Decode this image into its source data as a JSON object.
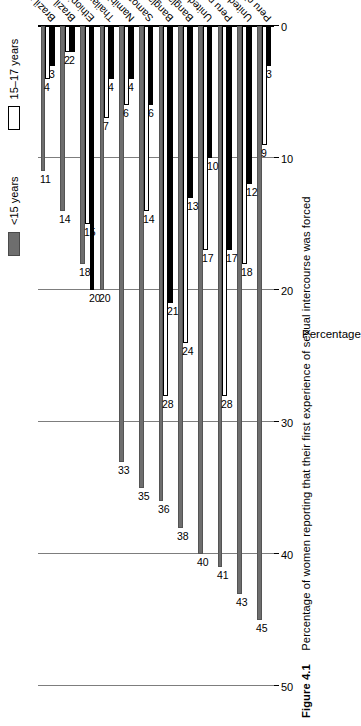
{
  "figure": {
    "number": "Figure 4.1",
    "caption": "Percentage of women reporting that their first experience of sexual intercourse was forced"
  },
  "legend": {
    "position": "top-left",
    "items": [
      {
        "label": "<15 years",
        "color": "#6e6e6e",
        "key": "under15"
      },
      {
        "label": "15–17 years",
        "color": "#ffffff",
        "key": "a1517"
      },
      {
        "label": "18+ years",
        "color": "#000000",
        "key": "a18plus"
      }
    ]
  },
  "axes": {
    "value_axis_label": "Percentage",
    "ticks": [
      "0",
      "10",
      "20",
      "30",
      "40",
      "50"
    ],
    "ylim": [
      0,
      50
    ],
    "grid": true
  },
  "chart_data": {
    "type": "bar",
    "orientation": "horizontal",
    "title": "Percentage of women reporting that their first experience of sexual intercourse was forced",
    "xlabel": "",
    "ylabel": "Percentage",
    "ylim": [
      0,
      50
    ],
    "grid": true,
    "legend_position": "top-left",
    "categories": [
      "Peru city",
      "United Republic of Tanzania province",
      "Peru province",
      "United Republic of Tanzania city",
      "Bangladesh city",
      "Bangladesh province",
      "Samoa",
      "Namibia city",
      "Thailand province",
      "Ethiopia province",
      "Brazil city",
      "Brazil province"
    ],
    "series": [
      {
        "name": "<15 years",
        "color": "#6e6e6e",
        "values": [
          45,
          43,
          41,
          40,
          38,
          36,
          35,
          33,
          20,
          18,
          14,
          11
        ]
      },
      {
        "name": "15–17 years",
        "color": "#ffffff",
        "values": [
          9,
          18,
          28,
          17,
          24,
          28,
          14,
          6,
          7,
          15,
          2,
          4
        ]
      },
      {
        "name": "18+ years",
        "color": "#000000",
        "values": [
          3,
          12,
          17,
          10,
          13,
          21,
          6,
          4,
          4,
          20,
          2,
          3
        ]
      }
    ]
  }
}
